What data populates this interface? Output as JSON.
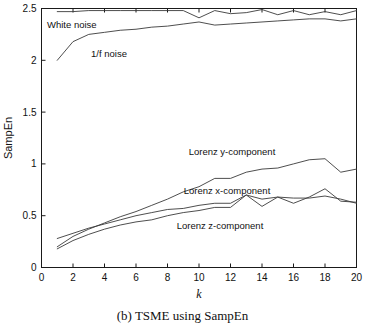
{
  "caption": "(b) TSME using SampEn",
  "axes": {
    "xlabel": "k",
    "ylabel": "SampEn",
    "xticks": [
      "0",
      "2",
      "4",
      "6",
      "8",
      "10",
      "12",
      "14",
      "16",
      "18",
      "20"
    ],
    "yticks": [
      "0",
      "0.5",
      "1",
      "1.5",
      "2",
      "2.5"
    ]
  },
  "annotations": {
    "white_noise": "White noise",
    "pink_noise": "1/f noise",
    "lorenz_y": "Lorenz y-component",
    "lorenz_x": "Lorenz x-component",
    "lorenz_z": "Lorenz z-component"
  },
  "chart_data": {
    "type": "line",
    "title": "(b) TSME using SampEn",
    "xlabel": "k",
    "ylabel": "SampEn",
    "xlim": [
      0,
      20
    ],
    "ylim": [
      0,
      2.5
    ],
    "grid": false,
    "legend": "inline-annotations",
    "x": [
      1,
      2,
      3,
      4,
      5,
      6,
      7,
      8,
      9,
      10,
      11,
      12,
      13,
      14,
      15,
      16,
      17,
      18,
      19,
      20
    ],
    "series": [
      {
        "name": "White noise",
        "values": [
          2.47,
          2.47,
          2.48,
          2.48,
          2.48,
          2.48,
          2.48,
          2.48,
          2.48,
          2.41,
          2.48,
          2.45,
          2.46,
          2.49,
          2.44,
          2.48,
          2.44,
          2.47,
          2.44,
          2.48
        ]
      },
      {
        "name": "1/f noise",
        "values": [
          2.0,
          2.18,
          2.25,
          2.27,
          2.29,
          2.3,
          2.32,
          2.33,
          2.35,
          2.37,
          2.34,
          2.35,
          2.36,
          2.37,
          2.38,
          2.39,
          2.4,
          2.4,
          2.38,
          2.4
        ]
      },
      {
        "name": "Lorenz y-component",
        "values": [
          0.2,
          0.3,
          0.37,
          0.43,
          0.49,
          0.54,
          0.6,
          0.66,
          0.73,
          0.78,
          0.86,
          0.86,
          0.92,
          0.95,
          0.96,
          1.0,
          1.04,
          1.05,
          0.92,
          0.95
        ]
      },
      {
        "name": "Lorenz x-component",
        "values": [
          0.28,
          0.33,
          0.38,
          0.42,
          0.46,
          0.5,
          0.53,
          0.56,
          0.57,
          0.6,
          0.62,
          0.62,
          0.7,
          0.59,
          0.68,
          0.62,
          0.68,
          0.76,
          0.64,
          0.63
        ]
      },
      {
        "name": "Lorenz z-component",
        "values": [
          0.18,
          0.26,
          0.32,
          0.37,
          0.41,
          0.44,
          0.46,
          0.5,
          0.53,
          0.55,
          0.58,
          0.58,
          0.7,
          0.66,
          0.68,
          0.67,
          0.67,
          0.69,
          0.66,
          0.62
        ]
      }
    ]
  }
}
